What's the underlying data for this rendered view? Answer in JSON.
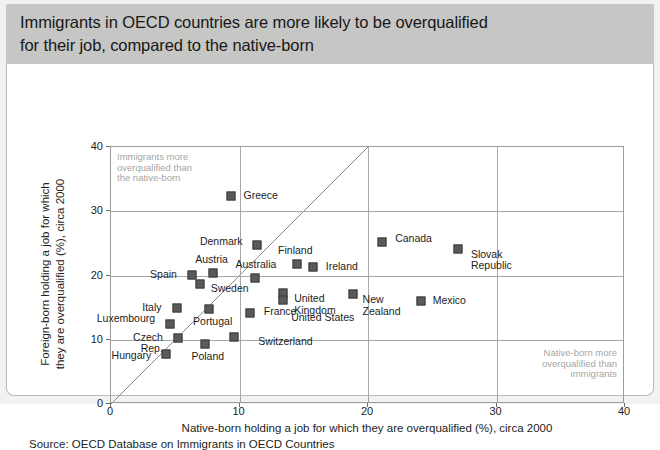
{
  "header": {
    "title": "Immigrants in OECD countries are more likely to be overqualified\nfor their job, compared to the native-born"
  },
  "source": "Source: OECD Database on Immigrants in OECD Countries",
  "annotations": {
    "top_left": "Immigrants more\noverqualified than\nthe native-born",
    "bottom_right": "Native-born more\noverqualified than\nimmigrants"
  },
  "chart_data": {
    "type": "scatter",
    "title": "Immigrants in OECD countries are more likely to be overqualified for their job, compared to the native-born",
    "xlabel": "Native-born holding a job for which they are overqualified (%), circa 2000",
    "ylabel": "Foreign-born holding a job for which\nthey are overqualified (%), circa 2000",
    "xlim": [
      0,
      40
    ],
    "ylim": [
      0,
      40
    ],
    "xticks": [
      0,
      10,
      20,
      30,
      40
    ],
    "yticks": [
      0,
      10,
      20,
      30,
      40
    ],
    "grid": true,
    "legend": "none",
    "reference_line": {
      "type": "45-degree",
      "from": [
        0,
        0
      ],
      "to": [
        40,
        40
      ]
    },
    "marker_color": "#5a5a58",
    "points": [
      {
        "label": "Greece",
        "x": 9.3,
        "y": 32.4,
        "lx": 13,
        "ly": 0,
        "align": "left"
      },
      {
        "label": "Denmark",
        "x": 11.4,
        "y": 24.8,
        "lx": -13,
        "ly": -3,
        "align": "right"
      },
      {
        "label": "Finland",
        "x": 14.5,
        "y": 21.8,
        "lx": -2,
        "ly": -13,
        "align": "center"
      },
      {
        "label": "Ireland",
        "x": 15.7,
        "y": 21.4,
        "lx": 13,
        "ly": 0,
        "align": "left"
      },
      {
        "label": "Canada",
        "x": 21.1,
        "y": 25.2,
        "lx": 13,
        "ly": -3,
        "align": "left"
      },
      {
        "label": "Slovak\nRepublic",
        "x": 27.0,
        "y": 24.2,
        "lx": 13,
        "ly": 6,
        "align": "left"
      },
      {
        "label": "Austria",
        "x": 7.9,
        "y": 20.4,
        "lx": -1,
        "ly": -13,
        "align": "center"
      },
      {
        "label": "Australia",
        "x": 11.2,
        "y": 19.6,
        "lx": 1,
        "ly": -13,
        "align": "center"
      },
      {
        "label": "Spain",
        "x": 6.3,
        "y": 20.1,
        "lx": -13,
        "ly": 0,
        "align": "right"
      },
      {
        "label": "Sweden",
        "x": 6.9,
        "y": 18.6,
        "lx": 11,
        "ly": 5,
        "align": "left"
      },
      {
        "label": "United\nKingdom",
        "x": 13.4,
        "y": 17.2,
        "lx": 11,
        "ly": 6,
        "align": "left"
      },
      {
        "label": "New\nZealand",
        "x": 18.8,
        "y": 17.1,
        "lx": 10,
        "ly": 6,
        "align": "left"
      },
      {
        "label": "Mexico",
        "x": 24.1,
        "y": 16.0,
        "lx": 12,
        "ly": 0,
        "align": "left"
      },
      {
        "label": "United States",
        "x": 13.4,
        "y": 16.2,
        "lx": 8,
        "ly": 18,
        "align": "left"
      },
      {
        "label": "Italy",
        "x": 5.1,
        "y": 15.0,
        "lx": -13,
        "ly": 0,
        "align": "right"
      },
      {
        "label": "France",
        "x": 10.8,
        "y": 14.2,
        "lx": 14,
        "ly": -1,
        "align": "left"
      },
      {
        "label": "Portugal",
        "x": 7.6,
        "y": 14.8,
        "lx": 4,
        "ly": 13,
        "align": "center"
      },
      {
        "label": "Luxembourg",
        "x": 4.6,
        "y": 12.4,
        "lx": -13,
        "ly": -5,
        "align": "right"
      },
      {
        "label": "Czech Rep.",
        "x": 5.2,
        "y": 10.3,
        "lx": -13,
        "ly": 0,
        "align": "right"
      },
      {
        "label": "Poland",
        "x": 7.3,
        "y": 9.4,
        "lx": 3,
        "ly": 13,
        "align": "center"
      },
      {
        "label": "Switzerland",
        "x": 9.6,
        "y": 10.4,
        "lx": 24,
        "ly": 5,
        "align": "left"
      },
      {
        "label": "Hungary",
        "x": 4.3,
        "y": 7.8,
        "lx": -13,
        "ly": 2,
        "align": "right"
      }
    ]
  }
}
